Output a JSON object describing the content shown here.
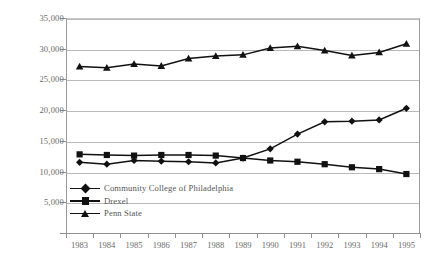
{
  "chart_data": {
    "type": "line",
    "title": "",
    "xlabel": "",
    "ylabel": "",
    "categories": [
      "1983",
      "1984",
      "1985",
      "1986",
      "1987",
      "1988",
      "1989",
      "1990",
      "1991",
      "1992",
      "1993",
      "1994",
      "1995"
    ],
    "ylim": [
      0,
      35000
    ],
    "ytick_values": [
      0,
      5000,
      10000,
      15000,
      20000,
      25000,
      30000,
      35000
    ],
    "ytick_labels": [
      "",
      "5,000",
      "10,000",
      "15,000",
      "20,000",
      "25,000",
      "30,000",
      "35,000"
    ],
    "grid": true,
    "legend_position": "inside-lower-left",
    "series": [
      {
        "name": "Community College of Philadelphia",
        "marker": "diamond",
        "color": "#111111",
        "values": [
          11500,
          11200,
          11800,
          11700,
          11600,
          11400,
          12200,
          13700,
          16100,
          18100,
          18200,
          18400,
          20300
        ]
      },
      {
        "name": "Drexel",
        "marker": "square",
        "color": "#111111",
        "values": [
          12800,
          12700,
          12600,
          12700,
          12700,
          12600,
          12200,
          11800,
          11600,
          11200,
          10700,
          10400,
          9600
        ]
      },
      {
        "name": "Penn State",
        "marker": "triangle",
        "color": "#111111",
        "values": [
          27100,
          26900,
          27500,
          27200,
          28400,
          28800,
          29000,
          30100,
          30400,
          29700,
          28900,
          29400,
          30800
        ]
      }
    ]
  },
  "legend": {
    "items": [
      {
        "label": "Community College of Philadelphia",
        "marker": "diamond"
      },
      {
        "label": "Drexel",
        "marker": "square"
      },
      {
        "label": "Penn State",
        "marker": "triangle"
      }
    ]
  }
}
